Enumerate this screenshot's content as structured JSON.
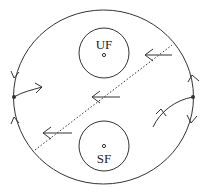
{
  "diagram": {
    "type": "phase-portrait",
    "stroke_color": "#333333",
    "background": "#ffffff",
    "boundary": {
      "shape": "circle",
      "cx": 103.5,
      "cy": 97,
      "rx": 90,
      "ry": 87
    },
    "regions": [
      {
        "id": "uf",
        "label": "UF",
        "cx": 104,
        "cy": 53,
        "r": 25,
        "dot": [
          104,
          55
        ],
        "label_pos": [
          104,
          49
        ]
      },
      {
        "id": "sf",
        "label": "SF",
        "cx": 104,
        "cy": 146,
        "r": 25,
        "dot": [
          104,
          146
        ],
        "label_pos": [
          104,
          163
        ]
      }
    ],
    "fixed_points": [
      {
        "id": "left",
        "x": 14,
        "y": 97
      },
      {
        "id": "right",
        "x": 193,
        "y": 97
      }
    ],
    "separatrix_line": {
      "style": "dotted",
      "from": [
        35,
        150
      ],
      "to": [
        172,
        45
      ]
    },
    "flow_arrows": [
      {
        "from": [
          172,
          55
        ],
        "to": [
          145,
          55
        ],
        "direction": "left"
      },
      {
        "from": [
          120,
          97
        ],
        "to": [
          92,
          97
        ],
        "direction": "left"
      },
      {
        "from": [
          72,
          133
        ],
        "to": [
          43,
          133
        ],
        "direction": "left"
      }
    ]
  }
}
